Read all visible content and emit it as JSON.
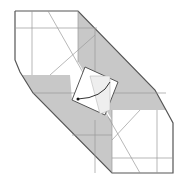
{
  "diagram": {
    "type": "origami-fold-step",
    "colors": {
      "paper_white": "#ffffff",
      "paper_shaded": "#c8c8c8",
      "outline": "#555555",
      "crease": "#aaaaaa",
      "arrow": "#333333"
    },
    "elements": [
      "outline",
      "shaded-flaps",
      "crease-lines",
      "center-square-flap",
      "fold-arrow"
    ]
  }
}
